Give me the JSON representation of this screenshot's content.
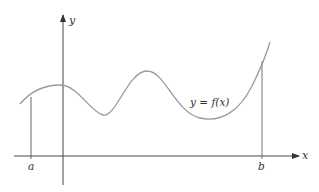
{
  "diagram": {
    "axes": {
      "x_label": "x",
      "y_label": "y"
    },
    "curve_label": "y = f(x)",
    "interval": {
      "left_label": "a",
      "right_label": "b"
    },
    "colors": {
      "axis": "#444444",
      "curve": "#9a9a9a",
      "bound_line": "#666666",
      "text": "#333333"
    }
  }
}
